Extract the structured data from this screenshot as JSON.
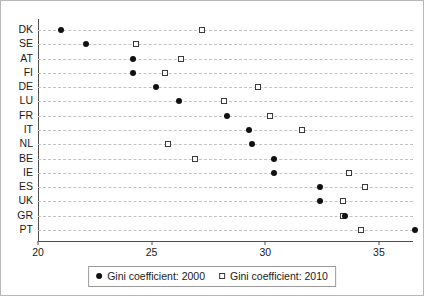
{
  "chart_data": {
    "type": "scatter",
    "title": "",
    "subtitle": "",
    "xlabel": "",
    "ylabel": "",
    "xlim": [
      20,
      36.5
    ],
    "ylim": null,
    "grid": true,
    "grid_style": "horizontal-dashed",
    "orientation": "horizontal-dot-plot",
    "legend_position": "bottom-center",
    "categories": [
      "DK",
      "SE",
      "AT",
      "FI",
      "DE",
      "LU",
      "FR",
      "IT",
      "NL",
      "BE",
      "IE",
      "ES",
      "UK",
      "GR",
      "PT"
    ],
    "xticks": [
      20,
      25,
      30,
      35
    ],
    "xtick_labels": [
      "20",
      "25",
      "30",
      "35"
    ],
    "series": [
      {
        "name": "Gini coefficient: 2000",
        "marker": "filled-circle",
        "color": "#111111",
        "values": [
          21.0,
          22.1,
          24.2,
          24.2,
          25.2,
          26.2,
          28.3,
          29.3,
          29.4,
          30.4,
          30.4,
          32.4,
          32.4,
          33.5,
          36.6
        ]
      },
      {
        "name": "Gini coefficient: 2010",
        "marker": "open-square",
        "color": "#3a3a3a",
        "values": [
          27.2,
          24.3,
          26.3,
          25.6,
          29.7,
          28.2,
          30.2,
          31.6,
          25.7,
          26.9,
          33.7,
          34.4,
          33.4,
          33.4,
          34.2
        ]
      }
    ]
  },
  "legend": {
    "entries": [
      {
        "label": "Gini coefficient: 2000",
        "marker": "filled-circle-icon"
      },
      {
        "label": "Gini coefficient: 2010",
        "marker": "open-square-icon"
      }
    ]
  }
}
